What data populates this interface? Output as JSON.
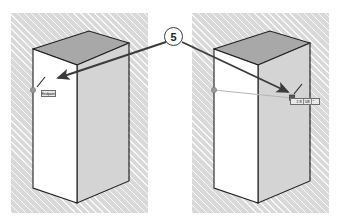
{
  "figure": {
    "background_color": "#ffffff",
    "width": 343,
    "height": 224
  },
  "callout": {
    "number": "5",
    "shape": "circle",
    "text_color": "#1d1d1d",
    "border_color": "#3a3a3a",
    "fill_color": "#ffffff"
  },
  "panels": {
    "hatch_fill": "#d9d9d9",
    "left": {
      "name": "Before state viewport",
      "box": {
        "front_face_color": "#ffffff",
        "side_face_color": "#d4d4d4",
        "top_face_color": "#a8a8a8",
        "edge_color": "#1f1f1f",
        "hidden_edge_style": "dashed"
      },
      "endpoint_marker": {
        "shape": "circle",
        "color": "#9a9a9a"
      },
      "tooltip": {
        "value": "Endpoint",
        "fill": "#e9e9e9",
        "border": "#6d6d6d"
      }
    },
    "right": {
      "name": "After state viewport",
      "box": {
        "front_face_color": "#ffffff",
        "side_face_color": "#d4d4d4",
        "top_face_color": "#a8a8a8",
        "edge_color": "#1f1f1f",
        "hidden_edge_style": "dashed"
      },
      "start_marker": {
        "shape": "circle",
        "color": "#9a9a9a"
      },
      "end_marker": {
        "shape": "square",
        "color": "#5a5a5a"
      },
      "guide_line_color": "#b5b5b5",
      "tooltip": {
        "segment_1": "1' 8",
        "segment_2": "5/8",
        "segment_3": "\"",
        "fill": "#e9e9e9",
        "border": "#6d6d6d"
      }
    }
  },
  "arrows": {
    "color": "#3b3b3b",
    "left_arrow": {
      "name": "callout-to-left-endpoint",
      "from": [
        166,
        44
      ],
      "to": [
        55,
        80
      ]
    },
    "right_arrow": {
      "name": "callout-to-right-endpoint",
      "from": [
        183,
        44
      ],
      "to": [
        291,
        93
      ]
    }
  }
}
